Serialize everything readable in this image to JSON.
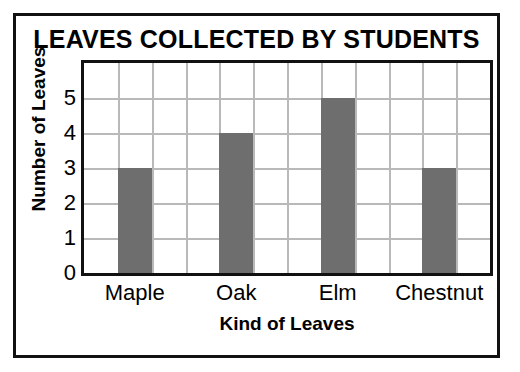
{
  "chart_data": {
    "type": "bar",
    "title": "LEAVES COLLECTED BY STUDENTS",
    "xlabel": "Kind of Leaves",
    "ylabel": "Number of Leaves",
    "categories": [
      "Maple",
      "Oak",
      "Elm",
      "Chestnut"
    ],
    "values": [
      3,
      4,
      5,
      3
    ],
    "ylim": [
      0,
      5.8
    ],
    "yticks": [
      0,
      1,
      2,
      3,
      4,
      5
    ],
    "ytick_labels": [
      "0",
      "1",
      "2",
      "3",
      "4",
      "5"
    ],
    "grid": true,
    "grid_rows": 6,
    "grid_columns": 12,
    "bar_columns": [
      2,
      5,
      8,
      11
    ],
    "legend": null,
    "colors": {
      "bar_fill": "#6e6e6e",
      "gridline": "#b9b9b9",
      "axis": "#111111",
      "background": "#ffffff",
      "text": "#000000"
    }
  }
}
